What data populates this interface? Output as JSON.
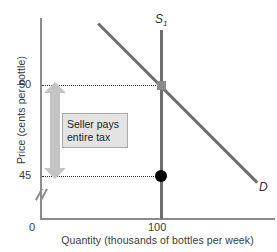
{
  "chart_data": {
    "type": "line",
    "title": "",
    "xlabel": "Quantity (thousands of bottles per week)",
    "ylabel": "Price (cents per bottle)",
    "xlim": [
      0,
      180
    ],
    "ylim": [
      44,
      56
    ],
    "grid": false,
    "legend_position": "inline-curve-labels",
    "x_ticks": [
      "0",
      "100"
    ],
    "y_ticks": [
      "50",
      "45"
    ],
    "axis_break_on_y": true,
    "series": [
      {
        "name": "S1",
        "label": "S",
        "label_subscript": "1",
        "type": "vertical-supply",
        "x_value": 100,
        "color": "#6e6e6e"
      },
      {
        "name": "D",
        "label": "D",
        "type": "downward-demand",
        "color": "#6e6e6e"
      }
    ],
    "markers": [
      {
        "name": "equilibrium-square",
        "shape": "square",
        "x": 100,
        "y": 50,
        "color": "#8a8a8a"
      },
      {
        "name": "after-tax-point",
        "shape": "circle",
        "x": 100,
        "y": 45,
        "color": "#000000"
      }
    ],
    "annotations": [
      {
        "name": "tax-incidence-note",
        "line1": "Seller pays",
        "line2": "entire tax",
        "arrow": "double-headed-vertical",
        "from_y": 45,
        "to_y": 50,
        "arrow_color": "#c4c4c4"
      }
    ],
    "reference_lines": [
      {
        "name": "price-50-dotted",
        "y": 50,
        "style": "dotted"
      },
      {
        "name": "price-45-dotted",
        "y": 45,
        "style": "dotted"
      }
    ]
  },
  "axes": {
    "y_title": "Price (cents per bottle)",
    "x_title": "Quantity (thousands of bottles per week)",
    "y_tick_50": "50",
    "y_tick_45": "45",
    "x_tick_origin": "0",
    "x_tick_100": "100"
  },
  "curves": {
    "supply_label": "S",
    "supply_subscript": "1",
    "demand_label": "D"
  },
  "annotation": {
    "line1": "Seller pays",
    "line2": "entire tax"
  },
  "colors": {
    "curve": "#6e6e6e",
    "axis": "#8c8c8c",
    "arrow": "#c4c4c4",
    "note_fill": "#e3e3e3",
    "note_border": "#a8a8a8",
    "dot": "#000000",
    "square_marker": "#8a8a8a",
    "text": "#3a3a3a"
  }
}
